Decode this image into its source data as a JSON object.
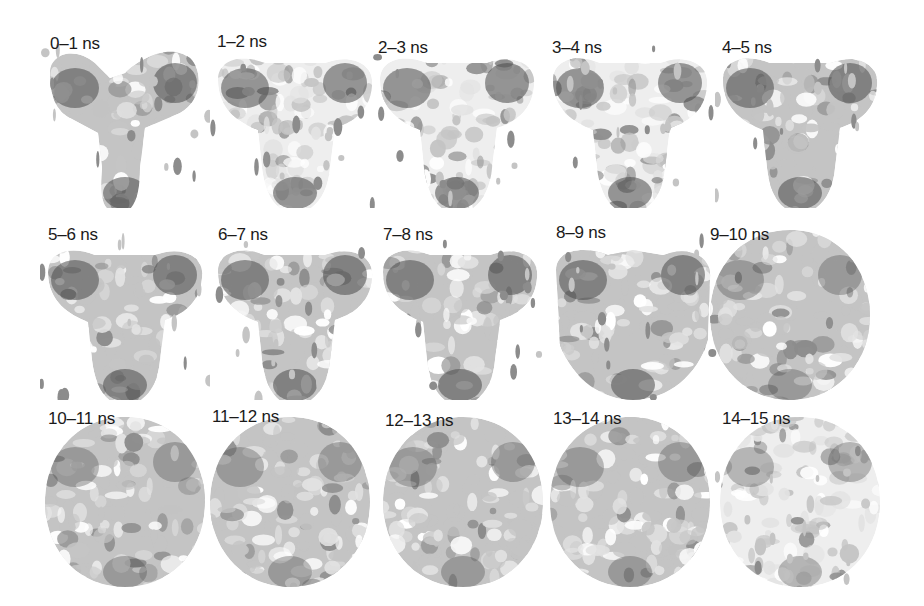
{
  "figure": {
    "layout": {
      "rows": 3,
      "columns": 5
    },
    "unit": "ns",
    "panels": [
      {
        "label": "0–1 ns",
        "shape": "y-shape",
        "row": 0,
        "col": 0,
        "x": 40,
        "y": 18,
        "lx": 10,
        "ly": 16
      },
      {
        "label": "1–2 ns",
        "shape": "t-sparse",
        "row": 0,
        "col": 1,
        "x": 210,
        "y": 18,
        "lx": 7,
        "ly": 14
      },
      {
        "label": "2–3 ns",
        "shape": "t-sparse",
        "row": 0,
        "col": 2,
        "x": 372,
        "y": 18,
        "lx": 6,
        "ly": 20
      },
      {
        "label": "3–4 ns",
        "shape": "t-sparse",
        "row": 0,
        "col": 3,
        "x": 545,
        "y": 18,
        "lx": 7,
        "ly": 20
      },
      {
        "label": "4–5 ns",
        "shape": "t-shape",
        "row": 0,
        "col": 4,
        "x": 715,
        "y": 18,
        "lx": 7,
        "ly": 20
      },
      {
        "label": "5–6 ns",
        "shape": "t-shape",
        "row": 1,
        "col": 0,
        "x": 40,
        "y": 210,
        "lx": 8,
        "ly": 15
      },
      {
        "label": "6–7 ns",
        "shape": "t-shape",
        "row": 1,
        "col": 1,
        "x": 210,
        "y": 210,
        "lx": 8,
        "ly": 15
      },
      {
        "label": "7–8 ns",
        "shape": "t-shape",
        "row": 1,
        "col": 2,
        "x": 375,
        "y": 210,
        "lx": 8,
        "ly": 15
      },
      {
        "label": "8–9 ns",
        "shape": "t-wide",
        "row": 1,
        "col": 3,
        "x": 548,
        "y": 210,
        "lx": 8,
        "ly": 13
      },
      {
        "label": "9–10 ns",
        "shape": "sphere",
        "row": 1,
        "col": 4,
        "x": 705,
        "y": 210,
        "lx": 5,
        "ly": 15
      },
      {
        "label": "10–11 ns",
        "shape": "sphere",
        "row": 2,
        "col": 0,
        "x": 40,
        "y": 397,
        "lx": 8,
        "ly": 12
      },
      {
        "label": "11–12 ns",
        "shape": "sphere",
        "row": 2,
        "col": 1,
        "x": 205,
        "y": 397,
        "lx": 7,
        "ly": 10
      },
      {
        "label": "12–13 ns",
        "shape": "sphere",
        "row": 2,
        "col": 2,
        "x": 378,
        "y": 397,
        "lx": 7,
        "ly": 14
      },
      {
        "label": "13–14 ns",
        "shape": "sphere",
        "row": 2,
        "col": 3,
        "x": 545,
        "y": 397,
        "lx": 8,
        "ly": 12
      },
      {
        "label": "14–15 ns",
        "shape": "sphere-sparse",
        "row": 2,
        "col": 4,
        "x": 715,
        "y": 397,
        "lx": 7,
        "ly": 12
      }
    ],
    "colors": {
      "dark": "#4a4a4a",
      "mid": "#8c8c8c",
      "light": "#c4c4c4",
      "pale": "#e2e2e2",
      "background": "#ffffff"
    }
  }
}
